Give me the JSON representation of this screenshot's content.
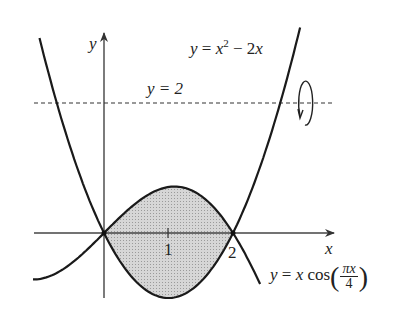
{
  "figure": {
    "axis_x_label": "x",
    "axis_y_label": "y",
    "tick_1": "1",
    "tick_2": "2",
    "line_label": "y = 2",
    "parabola_label": {
      "lhs": "y",
      "eq": " = ",
      "x": "x",
      "exp": "2",
      "rest": " − 2",
      "x2": "x"
    },
    "cos_label": {
      "lhs": "y",
      "eq": " = ",
      "x": "x",
      "cos": " cos",
      "num": "πx",
      "den": "4"
    },
    "colors": {
      "stroke": "#1a1a1a",
      "shade": "#cfcfcf",
      "axis": "#444444"
    }
  },
  "chart_data": {
    "type": "line",
    "title": "",
    "xlabel": "x",
    "ylabel": "y",
    "series": [
      {
        "name": "y = x^2 - 2x",
        "x": [
          -1,
          0,
          1,
          2,
          3
        ],
        "y": [
          3,
          0,
          -1,
          0,
          3
        ]
      },
      {
        "name": "y = x cos(pi x / 4)",
        "x": [
          -1,
          0,
          0.86,
          2,
          2.4
        ],
        "y": [
          -0.71,
          0,
          0.56,
          0,
          -0.74
        ]
      },
      {
        "name": "y = 2",
        "style": "dashed",
        "x": [
          -1.1,
          3.6
        ],
        "y": [
          2,
          2
        ]
      }
    ],
    "shaded_region": "between y = x cos(pi x/4) (top) and y = x^2 - 2x (bottom) for 0 <= x <= 2",
    "annotations": [
      "rotation arrow about y = 2"
    ],
    "xticks": [
      1,
      2
    ],
    "yticks": [
      2
    ],
    "grid": false
  }
}
